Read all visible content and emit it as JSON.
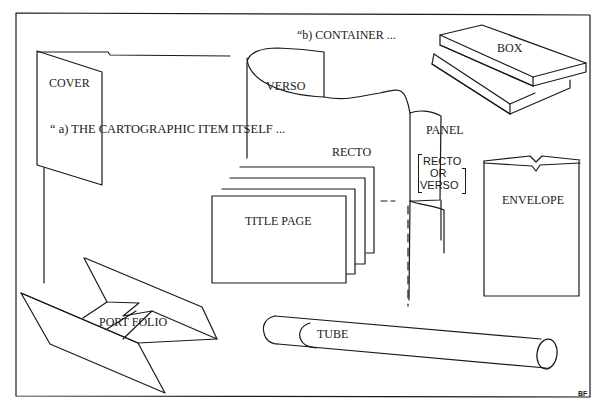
{
  "diagram": {
    "headings": {
      "a": "“ a) THE CARTOGRAPHIC ITEM ITSELF ...",
      "b": "“b) CONTAINER ..."
    },
    "labels": {
      "cover": "COVER",
      "verso": "VERSO",
      "recto": "RECTO",
      "panel": "PANEL",
      "panel_note_line1": "RECTO",
      "panel_note_line2": "OR",
      "panel_note_line3": "VERSO",
      "title_page": "TITLE PAGE",
      "box": "BOX",
      "envelope": "ENVELOPE",
      "portfolio": "PORT FOLIO",
      "tube": "TUBE"
    },
    "signature": "BF",
    "colors": {
      "ink": "#1a1a1a",
      "paper": "#ffffff"
    }
  }
}
